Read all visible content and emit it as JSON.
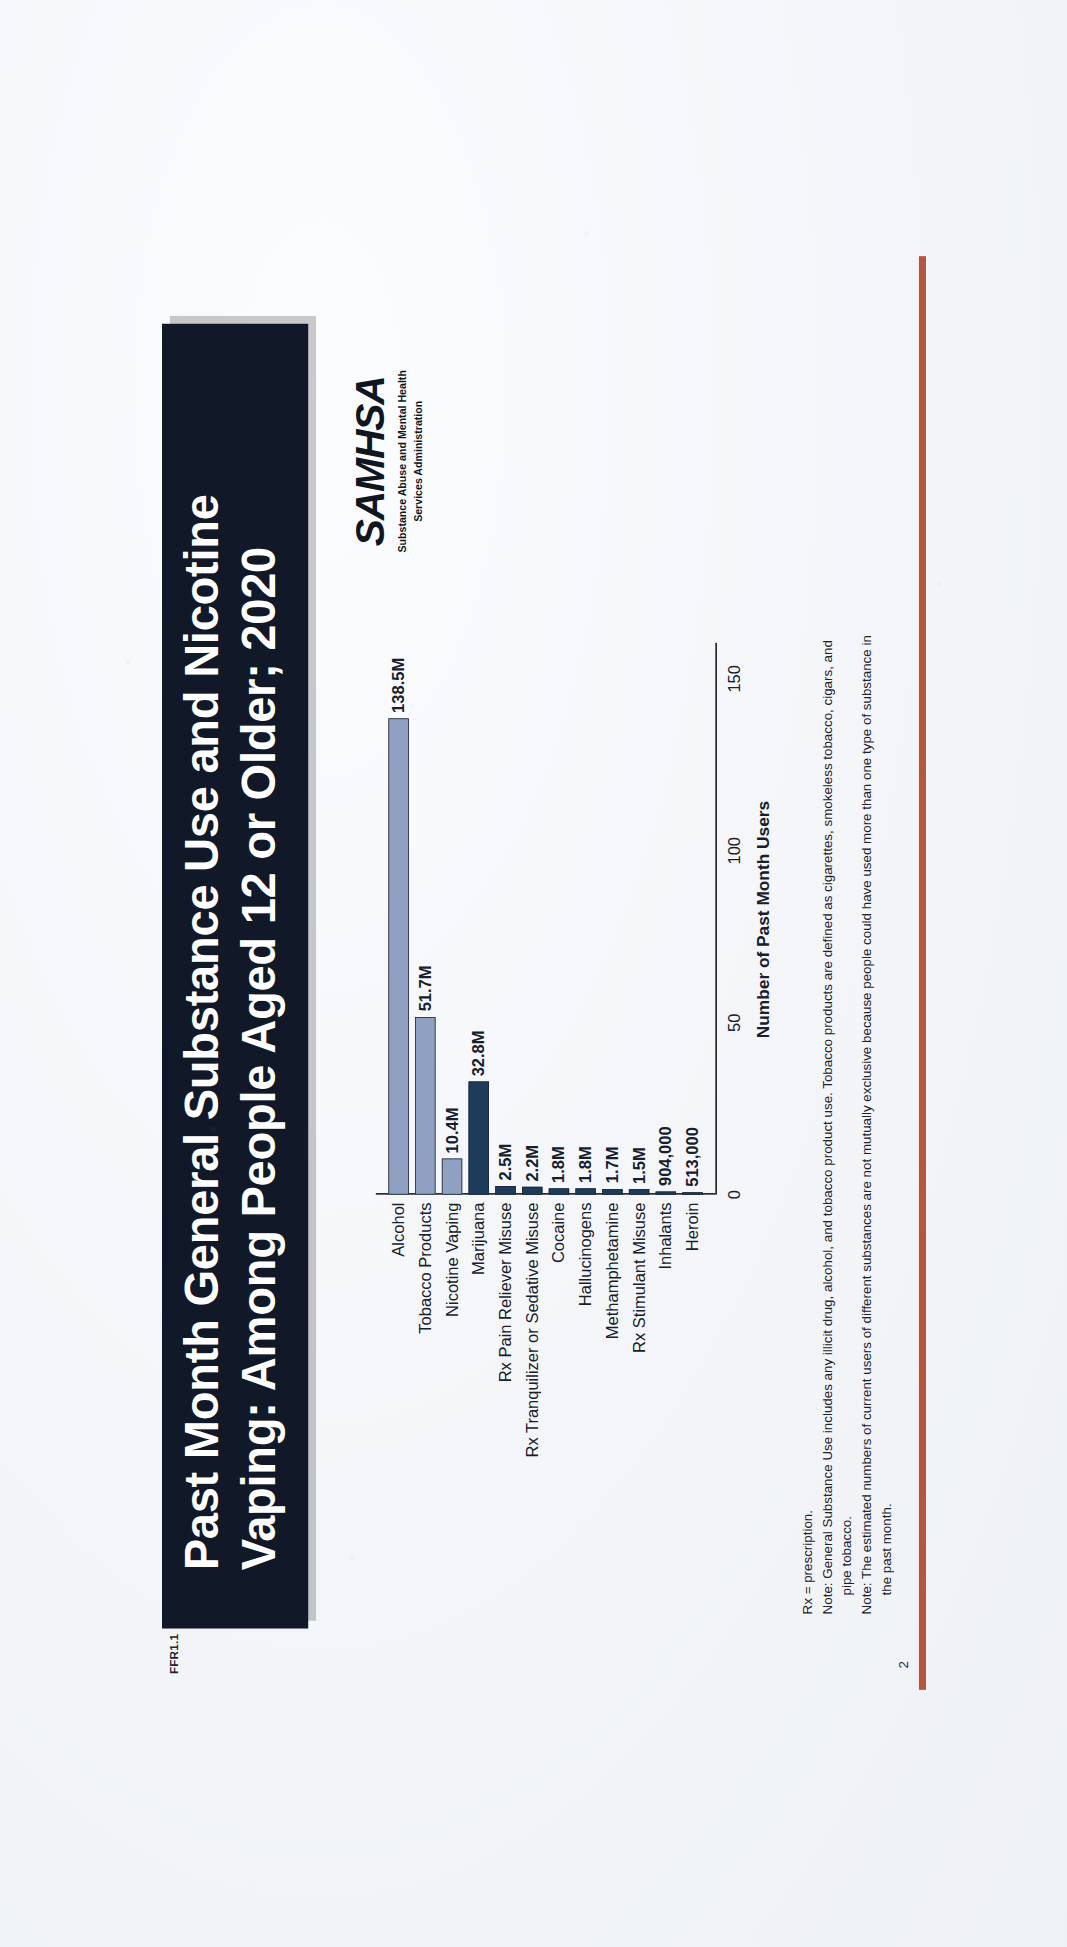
{
  "slide": {
    "figure_id": "FFR1.1",
    "title": "Past Month General Substance Use and Nicotine Vaping: Among People Aged 12 or Older; 2020",
    "page_number": "2"
  },
  "logo": {
    "wordmark": "SAMHSA",
    "line1": "Substance Abuse and Mental Health",
    "line2": "Services Administration"
  },
  "notes": {
    "rx": "Rx = prescription.",
    "note1": "Note: General Substance Use includes any illicit drug, alcohol, and tobacco product use. Tobacco products are defined as cigarettes, smokeless tobacco, cigars, and",
    "note1_cont": "pipe tobacco.",
    "note2": "Note: The estimated numbers of current users of different substances are not mutually exclusive because people could have used more than one type of substance in",
    "note2_cont": "the past month."
  },
  "chart_data": {
    "type": "bar",
    "orientation": "horizontal",
    "title": "",
    "xlabel": "Number of Past Month Users",
    "ylabel": "",
    "xlim": [
      0,
      160
    ],
    "ticks": [
      "0",
      "50",
      "100",
      "150"
    ],
    "tick_values": [
      0,
      50,
      100,
      150
    ],
    "grid": false,
    "legend": "none",
    "units": "millions of people",
    "categories": [
      "Alcohol",
      "Tobacco Products",
      "Nicotine Vaping",
      "Marijuana",
      "Rx Pain Reliever Misuse",
      "Rx Tranquilizer or Sedative Misuse",
      "Cocaine",
      "Hallucinogens",
      "Methamphetamine",
      "Rx Stimulant Misuse",
      "Inhalants",
      "Heroin"
    ],
    "values": [
      138.5,
      51.7,
      10.4,
      32.8,
      2.5,
      2.2,
      1.8,
      1.8,
      1.7,
      1.5,
      0.904,
      0.513
    ],
    "data_labels": [
      "138.5M",
      "51.7M",
      "10.4M",
      "32.8M",
      "2.5M",
      "2.2M",
      "1.8M",
      "1.8M",
      "1.7M",
      "1.5M",
      "904,000",
      "513,000"
    ],
    "bar_styles": [
      "light",
      "light",
      "light",
      "dark",
      "dark",
      "dark",
      "dark",
      "dark",
      "dark",
      "dark",
      "dark",
      "dark"
    ],
    "colors": {
      "light": "#8fa0c2",
      "dark": "#1d3c5c",
      "outline": "#1d2430",
      "banner": "#111827",
      "accent_rule": "#b4573f"
    }
  }
}
